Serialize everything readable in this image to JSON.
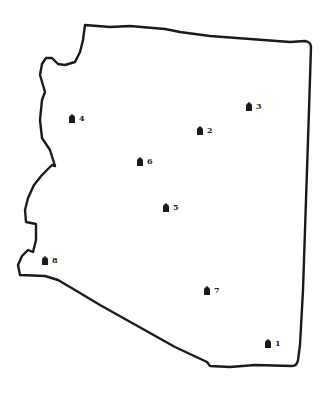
{
  "map": {
    "region": "Arizona state outline",
    "border_color": "#1a1a1a",
    "background": "#ffffff",
    "marker_icon": "building-icon",
    "markers": [
      {
        "label": "1",
        "x": 268,
        "y": 344
      },
      {
        "label": "2",
        "x": 200,
        "y": 131
      },
      {
        "label": "3",
        "x": 249,
        "y": 107
      },
      {
        "label": "4",
        "x": 72,
        "y": 119
      },
      {
        "label": "5",
        "x": 166,
        "y": 208
      },
      {
        "label": "6",
        "x": 140,
        "y": 162
      },
      {
        "label": "7",
        "x": 207,
        "y": 291
      },
      {
        "label": "8",
        "x": 45,
        "y": 261
      }
    ]
  }
}
